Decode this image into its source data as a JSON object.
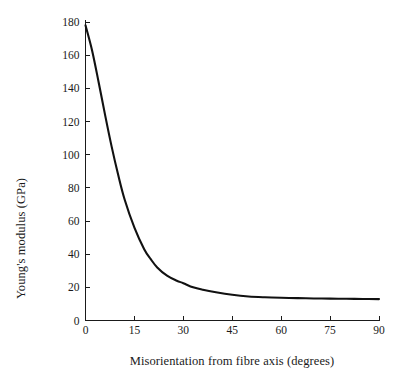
{
  "chart_data": {
    "type": "line",
    "title": "",
    "xlabel": "Misorientation from fibre axis (degrees)",
    "ylabel": "Young's modulus (GPa)",
    "xlim": [
      0,
      90
    ],
    "ylim": [
      0,
      180
    ],
    "xticks": [
      0,
      15,
      30,
      45,
      60,
      75,
      90
    ],
    "xtick_labels": [
      "0",
      "15",
      "30",
      "45",
      "60",
      "75",
      "90"
    ],
    "yticks": [
      0,
      20,
      40,
      60,
      80,
      100,
      120,
      140,
      160,
      180
    ],
    "ytick_labels": [
      "0",
      "20",
      "40",
      "60",
      "80",
      "100",
      "120",
      "140",
      "160",
      "180"
    ],
    "grid": false,
    "legend": null,
    "spines": [
      "left",
      "bottom"
    ],
    "tick_direction": "in",
    "line_color": "#111111",
    "series": [
      {
        "name": "Young's modulus",
        "x": [
          0,
          2,
          4,
          6,
          8,
          10,
          12,
          15,
          18,
          20,
          22,
          25,
          28,
          30,
          33,
          36,
          40,
          45,
          50,
          55,
          60,
          65,
          70,
          75,
          80,
          85,
          90
        ],
        "values": [
          178,
          163,
          144,
          124,
          105,
          88,
          73,
          56,
          43,
          37,
          32,
          27,
          24,
          22.5,
          20,
          18.5,
          17,
          15.5,
          14.5,
          14,
          13.7,
          13.5,
          13.3,
          13.2,
          13.1,
          13.0,
          12.9
        ]
      }
    ]
  },
  "axes": {
    "x_title": "Misorientation from fibre axis (degrees)",
    "y_title": "Young's modulus (GPa)"
  },
  "colors": {
    "background": "#ffffff",
    "ink": "#1a1a1a",
    "curve": "#111111"
  }
}
